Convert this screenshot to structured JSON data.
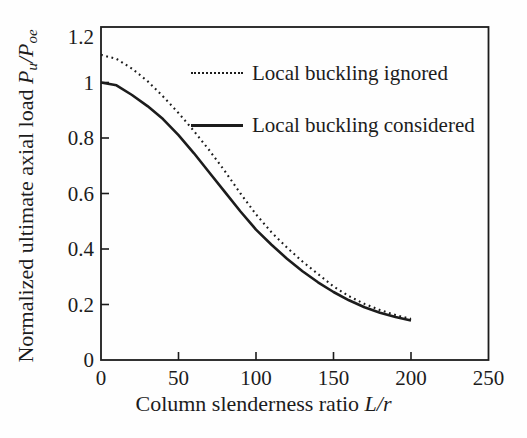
{
  "figure": {
    "background": "#fefefe",
    "ink_color": "#1c1c1c"
  },
  "chart_data": {
    "type": "line",
    "title": "",
    "xlabel": "Column slenderness ratio L/r",
    "ylabel": "Normalized ultimate axial load Pu/Poe",
    "xlabel_parts": {
      "prefix": "Column slenderness ratio",
      "variable": "L/r"
    },
    "ylabel_parts": {
      "prefix": "Normalized ultimate axial load",
      "p1": "P",
      "p1_sub": "u",
      "slash": "/",
      "p2": "P",
      "p2_sub": "oe"
    },
    "xlim": [
      0,
      250
    ],
    "ylim": [
      0,
      1.2
    ],
    "x_ticks": [
      0,
      50,
      100,
      150,
      200,
      250
    ],
    "x_tick_labels": [
      "0",
      "50",
      "100",
      "150",
      "200",
      "250"
    ],
    "y_ticks": [
      0,
      0.2,
      0.4,
      0.6,
      0.8,
      1,
      1.2
    ],
    "y_tick_labels": [
      "0",
      "0.2",
      "0.4",
      "0.6",
      "0.8",
      "1",
      "1.2"
    ],
    "grid": false,
    "legend_position": "upper-right-inside",
    "x": [
      0,
      10,
      20,
      30,
      40,
      50,
      60,
      70,
      80,
      90,
      100,
      110,
      120,
      130,
      140,
      150,
      160,
      170,
      180,
      190,
      200
    ],
    "series": [
      {
        "name": "Local buckling ignored",
        "style": "dotted",
        "values": [
          1.1,
          1.085,
          1.05,
          1.005,
          0.95,
          0.89,
          0.825,
          0.755,
          0.68,
          0.6,
          0.525,
          0.46,
          0.405,
          0.355,
          0.31,
          0.265,
          0.23,
          0.202,
          0.18,
          0.162,
          0.148
        ]
      },
      {
        "name": "Local buckling considered",
        "style": "solid",
        "values": [
          1.0,
          0.99,
          0.955,
          0.915,
          0.868,
          0.81,
          0.745,
          0.675,
          0.605,
          0.535,
          0.47,
          0.415,
          0.365,
          0.32,
          0.28,
          0.245,
          0.215,
          0.19,
          0.17,
          0.155,
          0.142
        ]
      }
    ]
  }
}
